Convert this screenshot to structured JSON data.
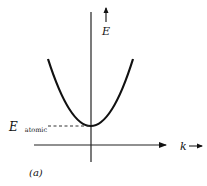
{
  "diagram": {
    "type": "dispersion-relation",
    "y_axis_label": "E",
    "x_axis_label": "k",
    "baseline_label_main": "E",
    "baseline_label_sub": "atomic",
    "panel_label": "(a)",
    "curve": "parabola",
    "curve_vertex": "E_atomic at k = 0"
  }
}
